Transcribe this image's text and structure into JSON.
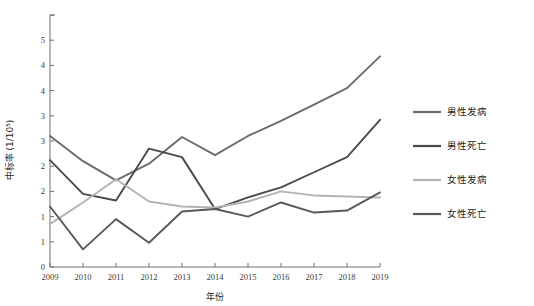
{
  "chart_data": {
    "type": "line",
    "title": "",
    "xlabel": "年份",
    "ylabel": "中标率 (1/10⁵)",
    "x": [
      2009,
      2010,
      2011,
      2012,
      2013,
      2014,
      2015,
      2016,
      2017,
      2018,
      2019
    ],
    "categories": [
      "2009",
      "2010",
      "2011",
      "2012",
      "2013",
      "2014",
      "2015",
      "2016",
      "2017",
      "2018",
      "2019"
    ],
    "xlim": [
      2009,
      2019
    ],
    "ylim": [
      0,
      5
    ],
    "ytick_values": [
      0,
      0.5,
      1.0,
      1.5,
      2.0,
      2.5,
      3.0,
      3.5,
      4.0,
      4.5,
      5.0
    ],
    "ytick_labels": [
      "0",
      "1",
      "1",
      "2",
      "2",
      "3",
      "3",
      "4",
      "4",
      "5"
    ],
    "ytick_labels_full": [
      "0",
      "0.5",
      "1.0",
      "1.5",
      "2.0",
      "2.5",
      "3.0",
      "3.5",
      "4.0",
      "4.5",
      "5.0"
    ],
    "grid": false,
    "legend_position": "right",
    "series": [
      {
        "name": "男性发病",
        "color": "#6b6b6b",
        "values": [
          2.6,
          2.1,
          1.72,
          2.05,
          2.58,
          2.22,
          2.6,
          2.9,
          3.22,
          3.55,
          4.18
        ]
      },
      {
        "name": "男性死亡",
        "color": "#4a4a4a",
        "values": [
          2.12,
          1.45,
          1.32,
          2.35,
          2.18,
          1.15,
          1.38,
          1.58,
          1.88,
          2.18,
          2.92
        ]
      },
      {
        "name": "女性发病",
        "color": "#b3b3b3",
        "values": [
          0.85,
          1.28,
          1.74,
          1.3,
          1.2,
          1.18,
          1.3,
          1.5,
          1.42,
          1.4,
          1.38
        ]
      },
      {
        "name": "女性死亡",
        "color": "#595959",
        "values": [
          1.2,
          0.35,
          0.95,
          0.48,
          1.1,
          1.15,
          1.0,
          1.28,
          1.08,
          1.12,
          1.48
        ]
      }
    ]
  },
  "legend": {
    "items": [
      {
        "label": "男性发病",
        "color": "#6b6b6b"
      },
      {
        "label": "男性死亡",
        "color": "#4a4a4a"
      },
      {
        "label": "女性发病",
        "color": "#b3b3b3"
      },
      {
        "label": "女性死亡",
        "color": "#595959"
      }
    ]
  },
  "axes": {
    "x_title": "年份",
    "y_title": "中标率 (1/10⁵)"
  }
}
